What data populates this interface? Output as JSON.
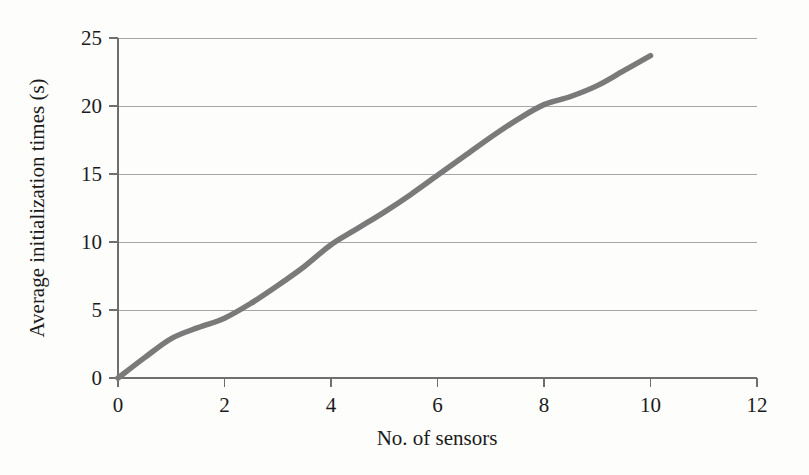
{
  "chart_data": {
    "type": "line",
    "title": "",
    "xlabel": "No. of sensors",
    "ylabel": "Average initialization times (s)",
    "xlim": [
      0,
      12
    ],
    "ylim": [
      0,
      25
    ],
    "xticks": [
      "0",
      "2",
      "4",
      "6",
      "8",
      "10",
      "12"
    ],
    "xtick_values": [
      0,
      2,
      4,
      6,
      8,
      10,
      12
    ],
    "yticks": [
      "0",
      "5",
      "10",
      "15",
      "20",
      "25"
    ],
    "ytick_values": [
      0,
      5,
      10,
      15,
      20,
      25
    ],
    "grid": "horizontal",
    "legend": "none",
    "series": [
      {
        "name": "Average initialization time",
        "color": "#7a7a7a",
        "x": [
          0,
          0.5,
          1,
          1.5,
          2,
          2.5,
          3,
          3.5,
          4,
          4.5,
          5,
          5.5,
          6,
          6.5,
          7,
          7.5,
          8,
          8.5,
          9,
          9.5,
          10
        ],
        "values": [
          0,
          1.5,
          2.9,
          3.7,
          4.4,
          5.5,
          6.8,
          8.2,
          9.8,
          11.0,
          12.2,
          13.5,
          14.9,
          16.3,
          17.7,
          19.0,
          20.1,
          20.7,
          21.5,
          22.6,
          23.7
        ]
      }
    ],
    "axis_color": "#6f6f6f",
    "gridline_color": "#a6a6a6",
    "background_color": "#fdfdfb"
  }
}
